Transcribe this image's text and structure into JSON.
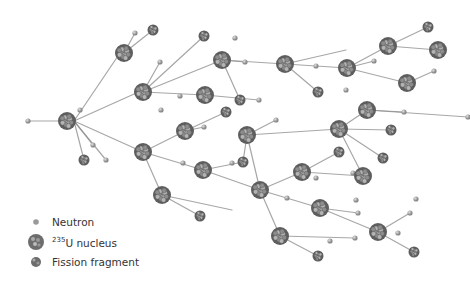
{
  "legend": [
    {
      "key": "neutron",
      "label": "Neutron"
    },
    {
      "key": "nucleus",
      "sup": "235",
      "label": "U nucleus"
    },
    {
      "key": "fragment",
      "label": "Fission fragment"
    }
  ],
  "colors": {
    "nucleus": "#6d6d6d",
    "neutron": "#9a9a9a",
    "line": "#7a7a7a"
  },
  "nodes": {
    "nuclei": [
      [
        67,
        121
      ],
      [
        124,
        53
      ],
      [
        143,
        92
      ],
      [
        143,
        152
      ],
      [
        185,
        131
      ],
      [
        203,
        170
      ],
      [
        222,
        60
      ],
      [
        205,
        95
      ],
      [
        247,
        135
      ],
      [
        260,
        190
      ],
      [
        285,
        64
      ],
      [
        302,
        172
      ],
      [
        320,
        208
      ],
      [
        347,
        68
      ],
      [
        339,
        129
      ],
      [
        367,
        110
      ],
      [
        388,
        46
      ],
      [
        407,
        83
      ],
      [
        438,
        50
      ],
      [
        363,
        176
      ],
      [
        378,
        232
      ],
      [
        280,
        236
      ],
      [
        162,
        195
      ]
    ],
    "fragments": [
      [
        153,
        30
      ],
      [
        204,
        36
      ],
      [
        240,
        100
      ],
      [
        226,
        112
      ],
      [
        84,
        160
      ],
      [
        318,
        92
      ],
      [
        391,
        130
      ],
      [
        383,
        158
      ],
      [
        339,
        152
      ],
      [
        243,
        162
      ],
      [
        200,
        216
      ],
      [
        318,
        256
      ],
      [
        414,
        252
      ],
      [
        428,
        27
      ]
    ],
    "neutrons": [
      [
        28,
        121
      ],
      [
        106,
        160
      ],
      [
        93,
        145
      ],
      [
        80,
        110
      ],
      [
        135,
        33
      ],
      [
        235,
        38
      ],
      [
        160,
        62
      ],
      [
        161,
        110
      ],
      [
        180,
        96
      ],
      [
        204,
        127
      ],
      [
        259,
        100
      ],
      [
        232,
        163
      ],
      [
        183,
        163
      ],
      [
        287,
        198
      ],
      [
        316,
        66
      ],
      [
        346,
        90
      ],
      [
        404,
        112
      ],
      [
        374,
        61
      ],
      [
        434,
        71
      ],
      [
        468,
        117
      ],
      [
        276,
        120
      ],
      [
        316,
        178
      ],
      [
        353,
        173
      ],
      [
        356,
        200
      ],
      [
        358,
        213
      ],
      [
        410,
        213
      ],
      [
        355,
        238
      ],
      [
        330,
        241
      ],
      [
        398,
        233
      ],
      [
        416,
        199
      ],
      [
        245,
        62
      ]
    ]
  },
  "edges": [
    [
      28,
      121,
      60,
      121
    ],
    [
      74,
      121,
      120,
      53
    ],
    [
      74,
      121,
      143,
      90
    ],
    [
      74,
      121,
      143,
      152
    ],
    [
      74,
      121,
      84,
      160
    ],
    [
      74,
      121,
      106,
      160
    ],
    [
      74,
      121,
      93,
      145
    ],
    [
      124,
      53,
      153,
      30
    ],
    [
      124,
      53,
      135,
      33
    ],
    [
      143,
      92,
      222,
      60
    ],
    [
      143,
      92,
      204,
      36
    ],
    [
      143,
      92,
      160,
      62
    ],
    [
      143,
      92,
      205,
      95
    ],
    [
      143,
      152,
      185,
      131
    ],
    [
      143,
      152,
      203,
      170
    ],
    [
      143,
      152,
      162,
      195
    ],
    [
      185,
      131,
      226,
      112
    ],
    [
      185,
      131,
      204,
      127
    ],
    [
      222,
      60,
      285,
      64
    ],
    [
      222,
      60,
      240,
      100
    ],
    [
      222,
      60,
      245,
      62
    ],
    [
      205,
      95,
      259,
      100
    ],
    [
      247,
      135,
      276,
      120
    ],
    [
      247,
      135,
      339,
      129
    ],
    [
      247,
      135,
      260,
      190
    ],
    [
      247,
      135,
      243,
      162
    ],
    [
      203,
      170,
      243,
      162
    ],
    [
      203,
      170,
      260,
      190
    ],
    [
      260,
      190,
      302,
      172
    ],
    [
      260,
      190,
      280,
      236
    ],
    [
      260,
      190,
      320,
      208
    ],
    [
      285,
      64,
      347,
      68
    ],
    [
      285,
      64,
      318,
      92
    ],
    [
      285,
      64,
      346,
      50
    ],
    [
      347,
      68,
      388,
      46
    ],
    [
      347,
      68,
      407,
      83
    ],
    [
      347,
      68,
      374,
      61
    ],
    [
      388,
      46,
      438,
      50
    ],
    [
      388,
      46,
      428,
      27
    ],
    [
      407,
      83,
      434,
      71
    ],
    [
      339,
      129,
      367,
      110
    ],
    [
      339,
      129,
      391,
      130
    ],
    [
      339,
      129,
      383,
      158
    ],
    [
      339,
      129,
      363,
      176
    ],
    [
      367,
      110,
      404,
      112
    ],
    [
      367,
      110,
      468,
      117
    ],
    [
      302,
      172,
      339,
      152
    ],
    [
      302,
      172,
      363,
      176
    ],
    [
      320,
      208,
      378,
      232
    ],
    [
      320,
      208,
      358,
      213
    ],
    [
      378,
      232,
      410,
      213
    ],
    [
      378,
      232,
      414,
      252
    ],
    [
      280,
      236,
      318,
      256
    ],
    [
      280,
      236,
      355,
      238
    ],
    [
      162,
      195,
      200,
      216
    ],
    [
      162,
      195,
      232,
      210
    ]
  ]
}
